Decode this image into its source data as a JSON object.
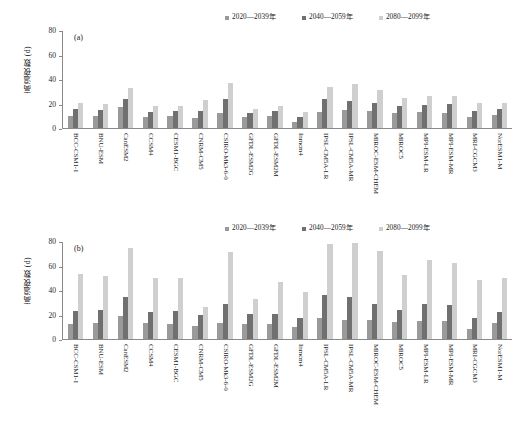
{
  "chart_data": [
    {
      "type": "bar",
      "panel": "(a)",
      "title": "",
      "xlabel": "",
      "ylabel": "高温夜数 (d)",
      "ylim": [
        0,
        80
      ],
      "yticks": [
        0,
        20,
        40,
        60,
        80
      ],
      "grid": false,
      "legend_position": "top-right",
      "categories": [
        "BCC-CSM1-1",
        "BNU-ESM",
        "CanESM2",
        "CCSM4",
        "CESM1-BGC",
        "CNRM-CM5",
        "CSIRO-Mk3-6-0",
        "GFDL-ESM2G",
        "GFDL-ESM2M",
        "Inmcm4",
        "IPSL-CM5A-LR",
        "IPSL-CM5A-MR",
        "MIROC-ESM-CHEM",
        "MIROC5",
        "MPI-ESM-LR",
        "MPI-ESM-MR",
        "MRI-CGCM3",
        "NorESM1-M"
      ],
      "series": [
        {
          "name": "2020—2039年",
          "color": "#9a9a9a",
          "values": [
            10,
            10,
            17,
            9,
            10,
            8,
            12,
            9,
            10,
            5,
            13,
            15,
            14,
            12,
            13,
            12,
            9,
            11
          ]
        },
        {
          "name": "2040—2059年",
          "color": "#707070",
          "values": [
            16,
            15,
            24,
            13,
            14,
            14,
            24,
            12,
            14,
            9,
            24,
            22,
            21,
            18,
            19,
            20,
            14,
            16
          ]
        },
        {
          "name": "2080—2099年",
          "color": "#cfcfcf",
          "values": [
            21,
            20,
            33,
            18,
            18,
            23,
            37,
            16,
            18,
            13,
            34,
            36,
            31,
            25,
            26,
            26,
            21,
            21
          ]
        }
      ]
    },
    {
      "type": "bar",
      "panel": "(b)",
      "title": "",
      "xlabel": "",
      "ylabel": "高温夜数 (d)",
      "ylim": [
        0,
        80
      ],
      "yticks": [
        0,
        20,
        40,
        60,
        80
      ],
      "grid": false,
      "legend_position": "top-right",
      "categories": [
        "BCC-CSM1-1",
        "BNU-ESM",
        "CanESM2",
        "CCSM4",
        "CESM1-BGC",
        "CNRM-CM5",
        "CSIRO-Mk3-6-0",
        "GFDL-ESM2G",
        "GFDL-ESM2M",
        "Inmcm4",
        "IPSL-CM5A-LR",
        "IPSL-CM5A-MR",
        "MIROC-ESM-CHEM",
        "MIROC5",
        "MPI-ESM-LR",
        "MPI-ESM-MR",
        "MRI-CGCM3",
        "NorESM1-M"
      ],
      "series": [
        {
          "name": "2020—2039年",
          "color": "#9a9a9a",
          "values": [
            12,
            13,
            19,
            13,
            12,
            11,
            13,
            12,
            12,
            10,
            17,
            16,
            16,
            14,
            15,
            15,
            8,
            13
          ]
        },
        {
          "name": "2040—2059年",
          "color": "#707070",
          "values": [
            23,
            24,
            35,
            22,
            23,
            20,
            29,
            21,
            21,
            17,
            36,
            35,
            29,
            24,
            29,
            28,
            17,
            22
          ]
        },
        {
          "name": "2080—2099年",
          "color": "#cfcfcf",
          "values": [
            54,
            52,
            75,
            50,
            50,
            26,
            72,
            33,
            47,
            39,
            78,
            79,
            73,
            53,
            65,
            63,
            49,
            50
          ]
        }
      ]
    }
  ],
  "legend": {
    "items": [
      {
        "label": "2020—2039年",
        "color": "#9a9a9a"
      },
      {
        "label": "2040—2059年",
        "color": "#707070"
      },
      {
        "label": "2080—2099年",
        "color": "#cfcfcf"
      }
    ]
  },
  "axis": {
    "ylabel": "高温夜数 (d)",
    "yticks": [
      "0",
      "20",
      "40",
      "60",
      "80"
    ]
  },
  "panels": {
    "a_tag": "(a)",
    "b_tag": "(b)"
  }
}
